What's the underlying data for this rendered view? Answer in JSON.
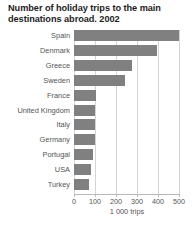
{
  "chart_data": {
    "type": "bar",
    "orientation": "horizontal",
    "title": "Number of holiday trips to the main destinations abroad. 2002",
    "title_line1": "Number of holiday trips to the main",
    "title_line2": "destinations abroad. 2002",
    "xlabel": "1 000 trips",
    "ylabel": "",
    "categories": [
      "Spain",
      "Denmark",
      "Greece",
      "Sweden",
      "France",
      "United Kingdom",
      "Italy",
      "Germany",
      "Portugal",
      "USA",
      "Turkey"
    ],
    "values": [
      500,
      395,
      278,
      243,
      105,
      100,
      100,
      98,
      92,
      80,
      70
    ],
    "xlim": [
      0,
      500
    ],
    "xticks": [
      0,
      100,
      200,
      300,
      400,
      500
    ],
    "xtick_labels": [
      "0",
      "100",
      "200",
      "300",
      "400",
      "500"
    ],
    "grid": "vertical",
    "legend": null,
    "bar_color": "#808080",
    "grid_color": "#d4d4d4",
    "background_color": "#ffffff",
    "text_color": "#555555"
  }
}
